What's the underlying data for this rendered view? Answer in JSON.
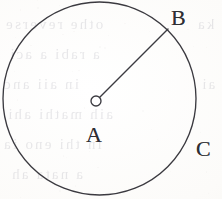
{
  "figure": {
    "kind": "circle-radius-diagram",
    "caption_present": false,
    "stroke_color": "#3b3a40",
    "paper_color": "#fbfaf8",
    "stroke_width_px": 1.3
  },
  "canvas": {
    "width": 222,
    "height": 199
  },
  "circle": {
    "name": "main-circle",
    "center_x": 99.5,
    "center_y": 98.5,
    "radius": 96.5,
    "stroke": "#3b3a40",
    "fill": "none"
  },
  "center_marker": {
    "name": "center-point-marker",
    "x": 96,
    "y": 101,
    "radius": 5,
    "style": "hollow-circle",
    "stroke": "#3b3a40",
    "fill": "#ffffff"
  },
  "radius_segment": {
    "name": "radius-AB",
    "from_x": 96,
    "from_y": 101,
    "to_x": 168,
    "to_y": 29,
    "stroke": "#3b3a40"
  },
  "labels": [
    {
      "id": "B",
      "text": "B",
      "x": 171,
      "y": 7,
      "refers_to": "point-on-circumference-endpoint-of-radius"
    },
    {
      "id": "A",
      "text": "A",
      "x": 86,
      "y": 124,
      "refers_to": "center-of-circle"
    },
    {
      "id": "C",
      "text": "C",
      "x": 196,
      "y": 138,
      "refers_to": "circumference-arc"
    }
  ],
  "background_bleed_text": [
    {
      "text": "othe reverse",
      "x": 4,
      "y": 16,
      "size": 15
    },
    {
      "text": "a rabi a aci",
      "x": 8,
      "y": 46,
      "size": 15
    },
    {
      "text": "in aii anc",
      "x": 2,
      "y": 76,
      "size": 15
    },
    {
      "text": "aih mathi ahi",
      "x": 6,
      "y": 106,
      "size": 15
    },
    {
      "text": "in thi eno ia",
      "x": 2,
      "y": 136,
      "size": 15
    },
    {
      "text": "a nata ah",
      "x": 10,
      "y": 166,
      "size": 15
    },
    {
      "text": "ka",
      "x": 196,
      "y": 16,
      "size": 15
    },
    {
      "text": "ai",
      "x": 200,
      "y": 76,
      "size": 15
    }
  ]
}
